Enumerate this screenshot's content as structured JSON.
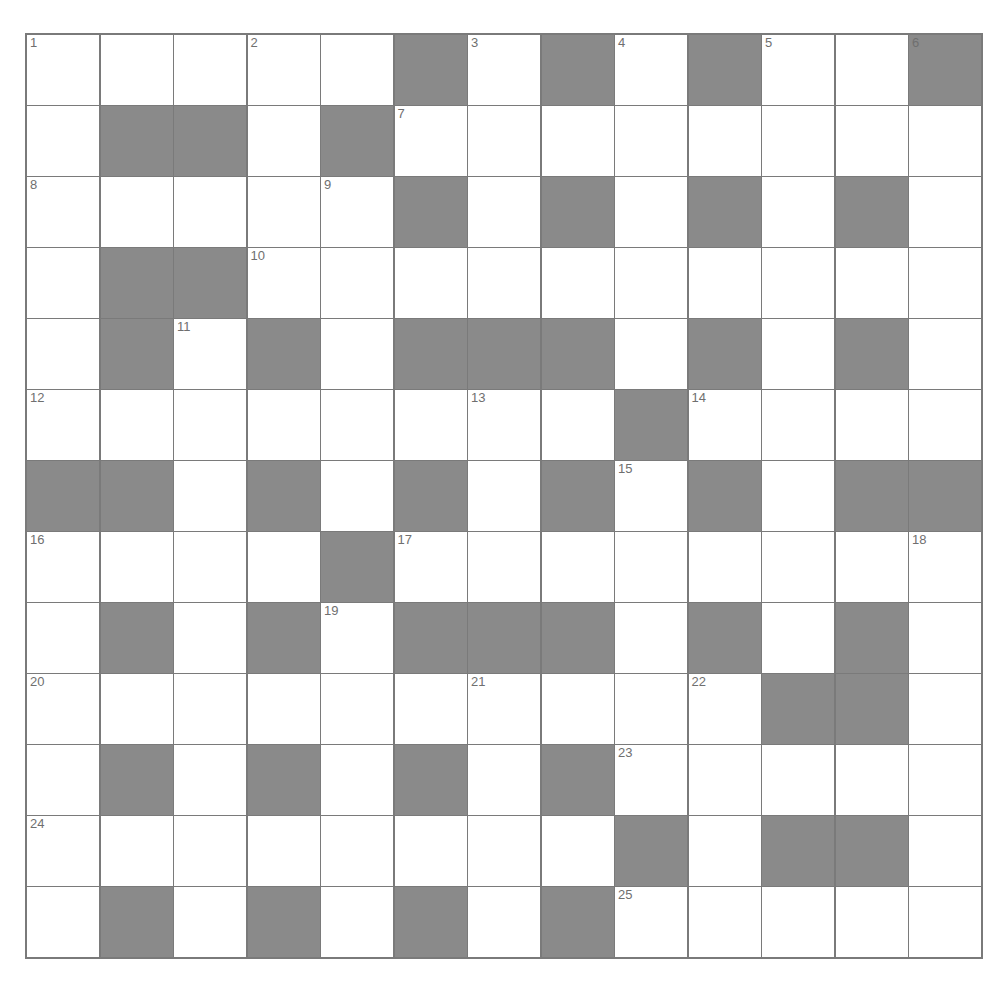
{
  "puzzle": {
    "rows": 13,
    "cols": 13,
    "colors": {
      "block": "#8a8a8a",
      "line": "#7a7a7a",
      "number": "#6f6f6f",
      "white": "#ffffff"
    },
    "layout": [
      "11111010101 01",
      "1001011111111",
      "1111101010101",
      "1001111111111",
      "1010100010101",
      "1111111101111",
      "0010101010100",
      "1111011111111",
      "1010100010101",
      "1111111111001",
      "1010101011111",
      "1111111101001",
      "1010101011111"
    ],
    "numbers": [
      {
        "r": 0,
        "c": 0,
        "n": "1"
      },
      {
        "r": 0,
        "c": 3,
        "n": "2"
      },
      {
        "r": 0,
        "c": 6,
        "n": "3"
      },
      {
        "r": 0,
        "c": 8,
        "n": "4"
      },
      {
        "r": 0,
        "c": 10,
        "n": "5"
      },
      {
        "r": 0,
        "c": 12,
        "n": "6"
      },
      {
        "r": 1,
        "c": 5,
        "n": "7"
      },
      {
        "r": 2,
        "c": 0,
        "n": "8"
      },
      {
        "r": 2,
        "c": 4,
        "n": "9"
      },
      {
        "r": 3,
        "c": 3,
        "n": "10"
      },
      {
        "r": 4,
        "c": 2,
        "n": "11"
      },
      {
        "r": 5,
        "c": 0,
        "n": "12"
      },
      {
        "r": 5,
        "c": 6,
        "n": "13"
      },
      {
        "r": 5,
        "c": 9,
        "n": "14"
      },
      {
        "r": 6,
        "c": 8,
        "n": "15"
      },
      {
        "r": 7,
        "c": 0,
        "n": "16"
      },
      {
        "r": 7,
        "c": 5,
        "n": "17"
      },
      {
        "r": 7,
        "c": 12,
        "n": "18"
      },
      {
        "r": 8,
        "c": 4,
        "n": "19"
      },
      {
        "r": 9,
        "c": 0,
        "n": "20"
      },
      {
        "r": 9,
        "c": 6,
        "n": "21"
      },
      {
        "r": 9,
        "c": 9,
        "n": "22"
      },
      {
        "r": 10,
        "c": 8,
        "n": "23"
      },
      {
        "r": 11,
        "c": 0,
        "n": "24"
      },
      {
        "r": 12,
        "c": 8,
        "n": "25"
      }
    ]
  }
}
